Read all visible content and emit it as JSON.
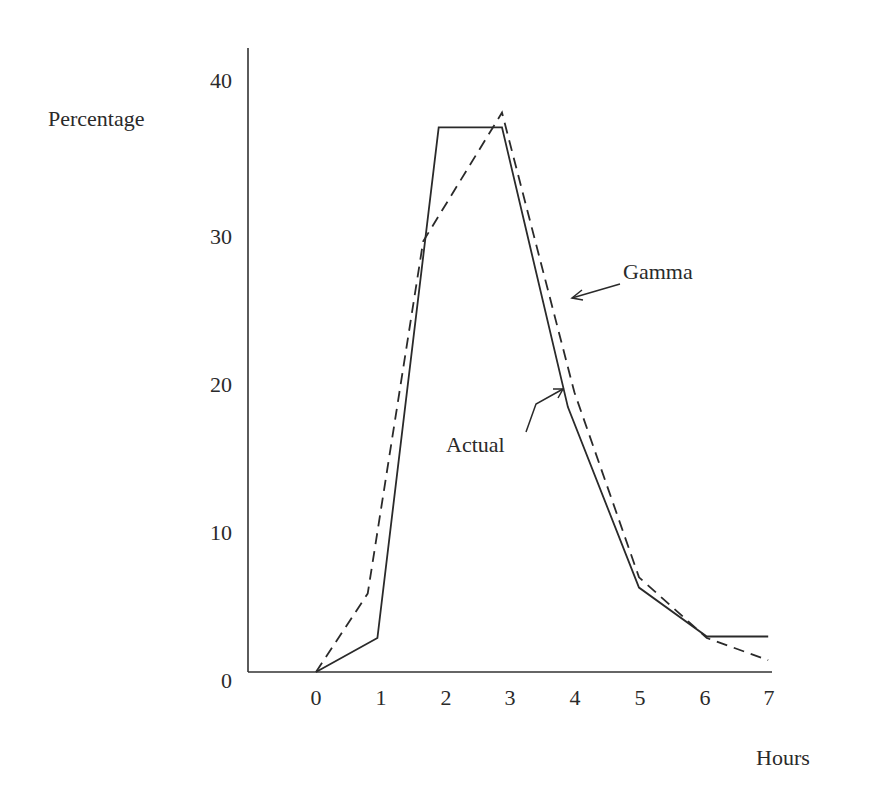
{
  "chart_data": {
    "type": "line",
    "title": "",
    "xlabel": "Hours",
    "ylabel": "Percentage",
    "xlim": [
      -1,
      7
    ],
    "ylim": [
      0,
      40
    ],
    "x_ticks": [
      "0",
      "1",
      "2",
      "3",
      "4",
      "5",
      "6",
      "7"
    ],
    "y_ticks": [
      "0",
      "10",
      "20",
      "30",
      "40"
    ],
    "grid": false,
    "legend": "none (inline arrow annotations)",
    "series": [
      {
        "name": "Actual",
        "style": "solid",
        "points": [
          [
            0,
            0
          ],
          [
            0.95,
            2.3
          ],
          [
            1.9,
            36.8
          ],
          [
            2.88,
            36.8
          ],
          [
            3.9,
            17.9
          ],
          [
            5,
            5.7
          ],
          [
            6.05,
            2.4
          ],
          [
            7,
            2.4
          ]
        ]
      },
      {
        "name": "Gamma",
        "style": "dashed",
        "points": [
          [
            0,
            0
          ],
          [
            0.8,
            5.3
          ],
          [
            1.66,
            29.1
          ],
          [
            2.88,
            37.8
          ],
          [
            4.0,
            18.9
          ],
          [
            5,
            6.4
          ],
          [
            6.05,
            2.3
          ],
          [
            7,
            0.8
          ]
        ]
      }
    ],
    "annotations": [
      {
        "text": "Gamma",
        "points_to": "dashed curve near x=3.9, y=21"
      },
      {
        "text": "Actual",
        "points_to": "solid curve near x=3.9, y=19"
      }
    ]
  },
  "labels": {
    "ylabel": "Percentage",
    "xlabel": "Hours",
    "gamma": "Gamma",
    "actual": "Actual",
    "y_ticks": [
      "0",
      "10",
      "20",
      "30",
      "40"
    ],
    "x_ticks": [
      "0",
      "1",
      "2",
      "3",
      "4",
      "5",
      "6",
      "7"
    ]
  },
  "colors": {
    "line": "#2a2a2a",
    "background": "#ffffff"
  }
}
